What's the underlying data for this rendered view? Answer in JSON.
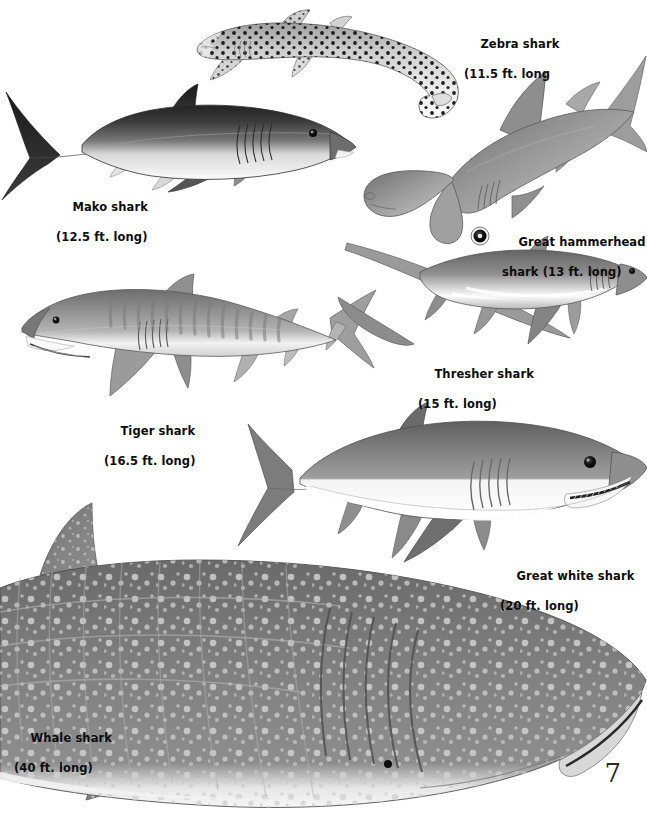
{
  "page": {
    "page_number": "7",
    "background_color": "#ffffff",
    "text_color": "#0d0d0d"
  },
  "sharks": [
    {
      "id": "zebra",
      "name": "Zebra shark",
      "size": "(11.5 ft. long",
      "length_ft": 11.5,
      "label_line1": "Zebra shark",
      "label_line2": "(11.5 ft. long",
      "orientation": "facing-left",
      "pattern": "black spots on pale body, very long tail"
    },
    {
      "id": "mako",
      "name": "Mako shark",
      "size": "(12.5 ft. long)",
      "length_ft": 12.5,
      "label_line1": "Mako shark",
      "label_line2": "(12.5 ft. long)",
      "orientation": "facing-right",
      "pattern": "dark gray back, white belly, crescent tail"
    },
    {
      "id": "hammerhead",
      "name": "Great hammerhead shark",
      "size": "(13 ft. long)",
      "length_ft": 13,
      "label_line1": "Great hammerhead",
      "label_line2": "shark (13 ft. long)",
      "orientation": "diagonal-head-lower-left",
      "pattern": "wide hammer-shaped head, tall dorsal fin"
    },
    {
      "id": "thresher",
      "name": "Thresher shark",
      "size": "(15 ft. long)",
      "length_ft": 15,
      "label_line1": "Thresher shark",
      "label_line2": "(15 ft. long)",
      "orientation": "facing-right",
      "pattern": "extremely long upper tail lobe sweeping upper-left"
    },
    {
      "id": "tiger",
      "name": "Tiger shark",
      "size": "(16.5 ft. long)",
      "length_ft": 16.5,
      "label_line1": "Tiger shark",
      "label_line2": "(16.5 ft. long)",
      "orientation": "facing-left",
      "pattern": "vertical bar stripes along gray flank"
    },
    {
      "id": "greatwhite",
      "name": "Great white shark",
      "size": "(20 ft. long)",
      "length_ft": 20,
      "label_line1": "Great white shark",
      "label_line2": "(20 ft. long)",
      "orientation": "facing-right",
      "pattern": "gray top, sharply divided white belly, toothy jaw"
    },
    {
      "id": "whale",
      "name": "Whale shark",
      "size": "(40 ft. long)",
      "length_ft": 40,
      "label_line1": "Whale shark",
      "label_line2": "(40 ft. long)",
      "orientation": "facing-right",
      "pattern": "huge body, pale spots and ridges, blunt wide snout"
    }
  ]
}
